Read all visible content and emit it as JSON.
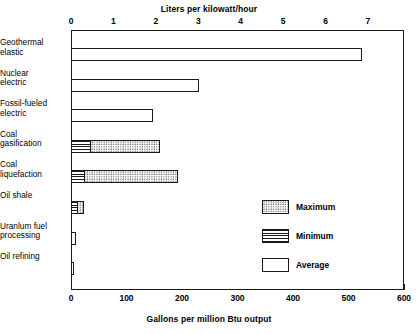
{
  "chart_data": {
    "type": "bar",
    "orientation": "horizontal",
    "title": "",
    "top_axis": {
      "label": "Liters per kilowatt/hour",
      "ticks": [
        0,
        1,
        2,
        3,
        4,
        5,
        6,
        7
      ],
      "range": [
        0,
        7.85
      ]
    },
    "bottom_axis": {
      "label": "Gallons per million Btu output",
      "ticks": [
        0,
        100,
        200,
        300,
        400,
        500,
        600
      ],
      "minor_tick_step": 20,
      "range": [
        0,
        600
      ]
    },
    "ylabel": "",
    "grid": false,
    "legend_position": "inside-right",
    "categories": [
      "Geothermal\nelastic",
      "Nuclear\nelectric",
      "Fossil-fueled\nelectric",
      "Coal\ngasification",
      "Coal\nliquefaction",
      "Oil shale",
      "Uranlum fuel\nprocessing",
      "Oil refining"
    ],
    "series": [
      {
        "name": "Average",
        "key": "average",
        "values": [
          525,
          230,
          148,
          null,
          null,
          null,
          9,
          5
        ]
      },
      {
        "name": "Minimum",
        "key": "minimum",
        "values": [
          null,
          null,
          null,
          36,
          26,
          12,
          null,
          null
        ]
      },
      {
        "name": "Maximum",
        "key": "maximum",
        "values": [
          null,
          null,
          null,
          160,
          193,
          23,
          null,
          null
        ]
      }
    ],
    "bars": [
      {
        "category": "Geothermal elastic",
        "type": "average",
        "average": 525
      },
      {
        "category": "Nuclear electric",
        "type": "average",
        "average": 230
      },
      {
        "category": "Fossil-fueled electric",
        "type": "average",
        "average": 148
      },
      {
        "category": "Coal gasification",
        "type": "range",
        "minimum": 36,
        "maximum": 160
      },
      {
        "category": "Coal liquefaction",
        "type": "range",
        "minimum": 26,
        "maximum": 193
      },
      {
        "category": "Oil shale",
        "type": "range",
        "minimum": 12,
        "maximum": 23
      },
      {
        "category": "Uranlum fuel processing",
        "type": "average",
        "average": 9
      },
      {
        "category": "Oil refining",
        "type": "average",
        "average": 5
      }
    ],
    "legend": [
      {
        "name": "Maximum",
        "pattern": "dotted"
      },
      {
        "name": "Minimum",
        "pattern": "horizontal-lines"
      },
      {
        "name": "Average",
        "pattern": "solid-white"
      }
    ],
    "colors": {
      "axis": "#1a1a1a",
      "bar_outline": "#1a1a1a",
      "average_fill": "#ffffff",
      "maximum_fill": "#e8e8e8",
      "minimum_fill": "#ffffff",
      "background": "#ffffff"
    }
  },
  "top_axis_title": "Liters per kilowatt/hour",
  "bottom_axis_title": "Gallons per million Btu output",
  "top_ticks": [
    "0",
    "1",
    "2",
    "3",
    "4",
    "5",
    "6",
    "7"
  ],
  "bottom_ticks": [
    "0",
    "100",
    "200",
    "300",
    "400",
    "500",
    "600"
  ],
  "categories": [
    {
      "line1": "Geothermal",
      "line2": "elastic"
    },
    {
      "line1": "Nuclear",
      "line2": "electric"
    },
    {
      "line1": "Fossil-fueled",
      "line2": "electric"
    },
    {
      "line1": "Coal",
      "line2": "gasification"
    },
    {
      "line1": "Coal",
      "line2": "liquefaction"
    },
    {
      "line1": "Oil shale",
      "line2": ""
    },
    {
      "line1": "Uranlum fuel",
      "line2": "processing"
    },
    {
      "line1": "Oil refining",
      "line2": ""
    }
  ],
  "legend": {
    "maximum_label": "Maximum",
    "minimum_label": "Minimum",
    "average_label": "Average"
  }
}
